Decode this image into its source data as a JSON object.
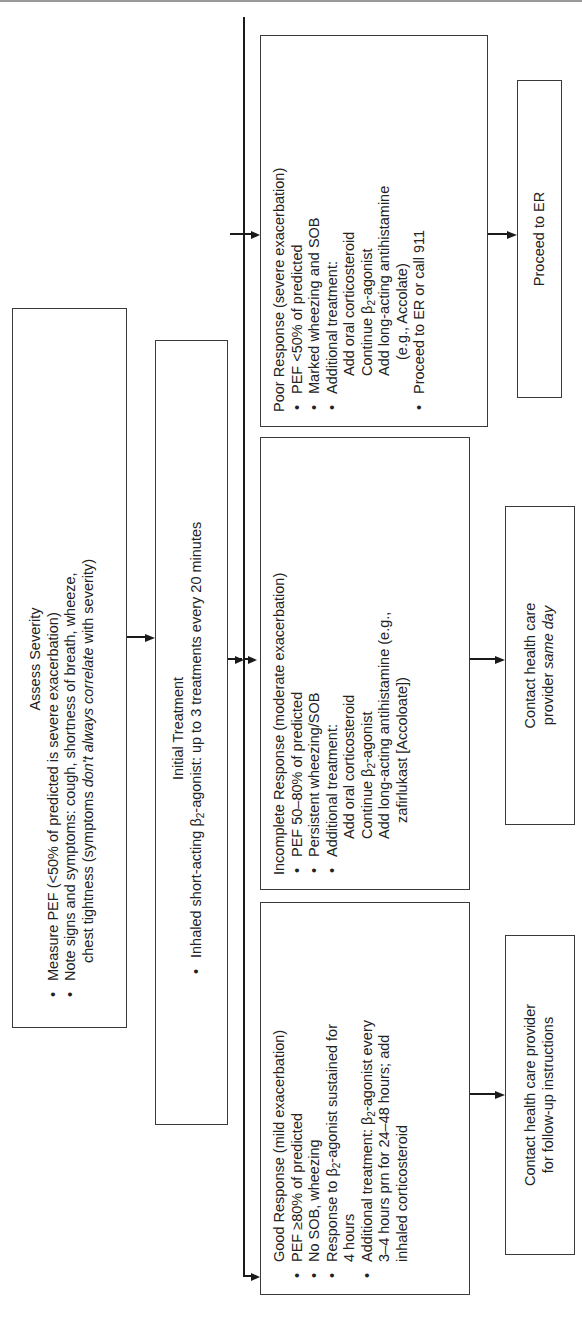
{
  "orientation": "rotated 90 degrees counter-clockwise",
  "assess": {
    "title": "Assess Severity",
    "bullets": [
      "Measure PEF (<50% of predicted is severe exacerbation)",
      "Note signs and symptoms: cough, shortness of breath, wheeze,"
    ],
    "continuation_prefix": "chest tightness (symptoms ",
    "continuation_italic": "don't always correlate",
    "continuation_suffix": " with severity)"
  },
  "initial": {
    "title": "Initial Treatment",
    "bullet_prefix": "Inhaled short-acting β",
    "bullet_sub": "2",
    "bullet_suffix": "-agonist: up to 3 treatments every 20 minutes"
  },
  "good": {
    "title": "Good Response (mild exacerbation)",
    "b1": "PEF ≥80% of predicted",
    "b2": "No SOB, wheezing",
    "b3_prefix": "Response to β",
    "b3_sub": "2",
    "b3_suffix": "-agonist sustained for",
    "b3_cont": "4 hours",
    "b4_prefix": "Additional treatment: β",
    "b4_sub": "2",
    "b4_suffix": "-agonist every",
    "b4_cont1": "3–4 hours prn for 24–48 hours; add",
    "b4_cont2": "inhaled corticosteroid"
  },
  "incomplete": {
    "title": "Incomplete Response (moderate exacerbation)",
    "b1": "PEF 50–80% of predicted",
    "b2": "Persistent wheezing/SOB",
    "b3": "Additional treatment:",
    "s1": "Add oral corticosteroid",
    "s2_prefix": "Continue β",
    "s2_sub": "2",
    "s2_suffix": "-agonist",
    "s3": "Add long-acting antihistamine (e.g.,",
    "s3_cont": "zafirlukast [Accoloate])"
  },
  "poor": {
    "title": "Poor Response (severe exacerbation)",
    "b1": "PEF <50% of predicted",
    "b2": "Marked wheezing and SOB",
    "b3": "Additional treatment:",
    "s1": "Add oral corticosteroid",
    "s2_prefix": "Continue β",
    "s2_sub": "2",
    "s2_suffix": "-agonist",
    "s3": "Add long-acting antihistamine",
    "s3_cont": "(e.g., Accolate)",
    "b4": "Proceed to ER or call 911"
  },
  "outcomes": {
    "follow_up_line1": "Contact health care provider",
    "follow_up_line2": "for follow-up instructions",
    "same_day_line1": "Contact health care",
    "same_day_line2_prefix": "provider ",
    "same_day_line2_italic": "same day",
    "er": "Proceed to ER"
  }
}
